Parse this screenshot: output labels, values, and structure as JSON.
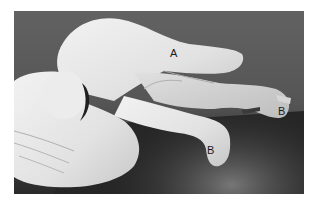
{
  "figure": {
    "background_color": "#5a5a5a",
    "labels": [
      {
        "id": "label-a",
        "text": "A",
        "x": 156,
        "y": 37
      },
      {
        "id": "label-b-right",
        "text": "B",
        "x": 264,
        "y": 95
      },
      {
        "id": "label-b-lower",
        "text": "B",
        "x": 193,
        "y": 134
      }
    ]
  }
}
